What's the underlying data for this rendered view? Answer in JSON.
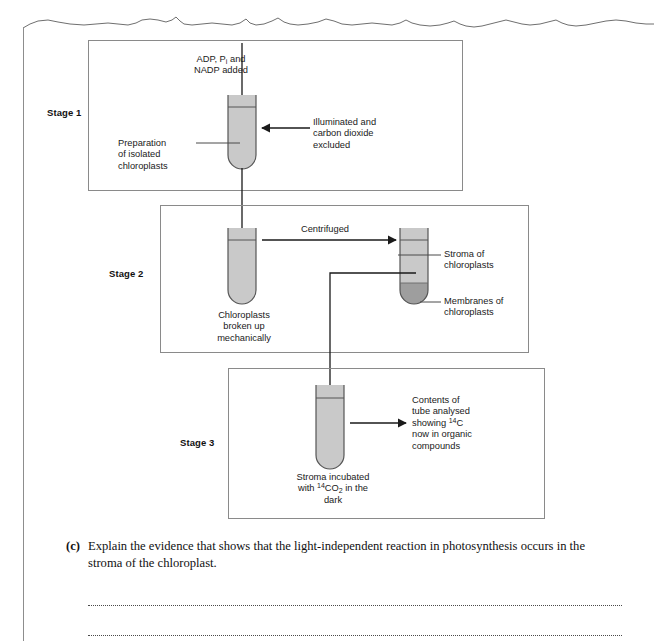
{
  "page": {
    "torn_edge": "torn-paper-top-edge",
    "left_margin_rule": true
  },
  "diagram": {
    "stages": [
      {
        "id": "stage-1",
        "label": "Stage 1",
        "tube_fill_color": "#c9c9c9",
        "annotations": {
          "input": "ADP, Pᵢ and\nNADP added",
          "input_plain": "ADP, Pi and NADP added",
          "tube_label": "Preparation\nof isolated\nchloroplasts",
          "condition": "Illuminated and\ncarbon dioxide\nexcluded"
        }
      },
      {
        "id": "stage-2",
        "label": "Stage 2",
        "tube_fill_color": "#c9c9c9",
        "pellet_color": "#9e9e9e",
        "annotations": {
          "process": "Centrifuged",
          "left_tube_label": "Chloroplasts\nbroken up\nmechanically",
          "upper_layer_label": "Stroma of\nchloroplasts",
          "lower_layer_label": "Membranes of\nchloroplasts"
        }
      },
      {
        "id": "stage-3",
        "label": "Stage 3",
        "tube_fill_color": "#c9c9c9",
        "annotations": {
          "tube_label": "Stroma incubated\nwith ¹⁴CO₂ in the\ndark",
          "tube_label_plain": "Stroma incubated with 14CO2 in the dark",
          "result": "Contents of\ntube analysed\nshowing ¹⁴C\nnow in organic\ncompounds",
          "result_plain": "Contents of tube analysed showing 14C now in organic compounds"
        }
      }
    ],
    "colors": {
      "box_border": "#7a7a7a",
      "tube_outline": "#5a5a5a",
      "tube_fill": "#c9c9c9",
      "pellet_fill": "#9e9e9e",
      "arrow": "#1a1a1a",
      "leader_line": "#3a3a3a"
    }
  },
  "question": {
    "marker": "(c)",
    "text": "Explain the evidence that shows that the light-independent reaction in photosynthesis occurs in the stroma of the chloroplast.",
    "answer_lines": 2
  }
}
